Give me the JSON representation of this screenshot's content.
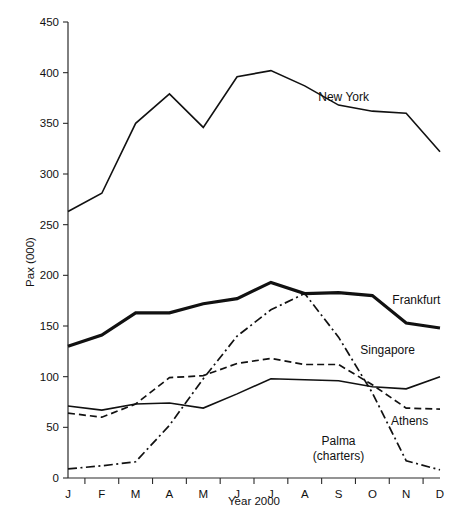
{
  "chart_data": {
    "type": "line",
    "title": "",
    "subtitle": "",
    "xlabel": "Year 2000",
    "ylabel": "Pax (000)",
    "categories": [
      "J",
      "F",
      "M",
      "A",
      "M",
      "J",
      "J",
      "A",
      "S",
      "O",
      "N",
      "D"
    ],
    "xlim": [
      0,
      11
    ],
    "ylim": [
      0,
      450
    ],
    "yticks": [
      0,
      50,
      100,
      150,
      200,
      250,
      300,
      350,
      400,
      450
    ],
    "ytick_labels": [
      "0",
      "50",
      "100",
      "150",
      "200",
      "250",
      "300",
      "350",
      "400",
      "450"
    ],
    "grid": false,
    "legend_position": "inline-right-labels",
    "series": [
      {
        "name": "New York",
        "style": "solid",
        "width": 1.6,
        "color": "#111111",
        "label_x": 8.15,
        "label_y": 372,
        "values": [
          263,
          281,
          350,
          379,
          346,
          396,
          402,
          387,
          368,
          362,
          360,
          322
        ]
      },
      {
        "name": "Frankfurt",
        "style": "solid",
        "width": 3.2,
        "color": "#111111",
        "label_x": 10.3,
        "label_y": 172,
        "values": [
          130,
          141,
          163,
          163,
          172,
          177,
          193,
          182,
          183,
          180,
          153,
          148
        ]
      },
      {
        "name": "Singapore",
        "style": "solid",
        "width": 1.6,
        "color": "#111111",
        "label_x": 9.45,
        "label_y": 122,
        "values": [
          71,
          67,
          73,
          74,
          69,
          83,
          98,
          97,
          96,
          90,
          88,
          100
        ]
      },
      {
        "name": "Athens",
        "style": "dashed",
        "width": 1.7,
        "color": "#111111",
        "label_x": 10.1,
        "label_y": 52,
        "values": [
          64,
          60,
          73,
          99,
          101,
          113,
          118,
          112,
          112,
          92,
          69,
          68
        ]
      },
      {
        "name": "Palma (charters)",
        "style": "dashdot",
        "width": 1.7,
        "color": "#111111",
        "label_line1": "Palma",
        "label_line2": "(charters)",
        "label_x": 8.0,
        "label_y": 33,
        "values": [
          9,
          12,
          16,
          52,
          98,
          140,
          166,
          182,
          139,
          84,
          17,
          8
        ]
      }
    ],
    "annotations": []
  },
  "axes": {
    "y_axis_title": "Pax (000)",
    "x_axis_title": "Year 2000"
  }
}
